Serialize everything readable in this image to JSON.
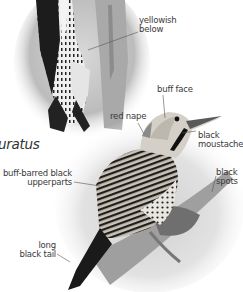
{
  "page": {
    "type": "field-guide-illustration"
  },
  "scientific_name_fragment": "uratus",
  "labels": {
    "yellowish_below": [
      "yellowish",
      "below"
    ],
    "buff_face": "buff face",
    "red_nape": "red nape",
    "black_moustache": [
      "black",
      "moustache"
    ],
    "buff_barred_upperparts": [
      "buff-barred black",
      "upperparts"
    ],
    "black_spots": [
      "black",
      "spots"
    ],
    "long_black_tail": [
      "long",
      "black tail"
    ]
  },
  "colors": {
    "label_text": "#3a3a3a",
    "leader_line": "#555555",
    "background": "#ffffff"
  }
}
